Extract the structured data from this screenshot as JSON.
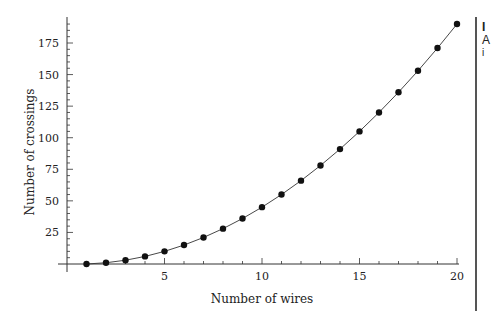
{
  "chart_data": {
    "type": "line",
    "title": "",
    "xlabel": "Number of wires",
    "ylabel": "Number of crossings",
    "x": [
      1,
      2,
      3,
      4,
      5,
      6,
      7,
      8,
      9,
      10,
      11,
      12,
      13,
      14,
      15,
      16,
      17,
      18,
      19,
      20
    ],
    "series": [
      {
        "name": "crossings",
        "values": [
          0,
          1,
          3,
          6,
          10,
          15,
          21,
          28,
          36,
          45,
          55,
          66,
          78,
          91,
          105,
          120,
          136,
          153,
          171,
          190
        ],
        "marker": "circle",
        "line": true
      }
    ],
    "x_ticks": [
      5,
      10,
      15,
      20
    ],
    "y_ticks": [
      25,
      50,
      75,
      100,
      125,
      150,
      175
    ],
    "xlim": [
      0,
      20
    ],
    "ylim": [
      0,
      190
    ],
    "grid": false,
    "legend": null
  },
  "sidebar_fragments": [
    "I",
    "A",
    "i"
  ],
  "colors": {
    "ink": "#111111",
    "axis": "#333333"
  }
}
